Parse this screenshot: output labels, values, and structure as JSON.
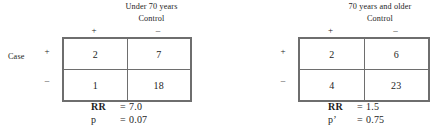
{
  "figure": {
    "panels": [
      {
        "stratum_title": "Under 70 years",
        "control_label": "Control",
        "row_group_label": "Case",
        "column_signs": [
          "+",
          "–"
        ],
        "row_signs": [
          "+",
          "–"
        ],
        "cells": [
          [
            "2",
            "7"
          ],
          [
            "1",
            "18"
          ]
        ],
        "stats": [
          {
            "key": "RR",
            "eq": "=",
            "value": "7.0"
          },
          {
            "key": "p",
            "eq": "=",
            "value": "0.07"
          }
        ]
      },
      {
        "stratum_title": "70 years and older",
        "control_label": "Control",
        "row_group_label": "",
        "column_signs": [
          "+",
          "–"
        ],
        "row_signs": [
          "+",
          "–"
        ],
        "cells": [
          [
            "2",
            "6"
          ],
          [
            "4",
            "23"
          ]
        ],
        "stats": [
          {
            "key": "RR",
            "eq": "=",
            "value": "1.5"
          },
          {
            "key": "p’",
            "eq": "=",
            "value": "0.75"
          }
        ]
      }
    ],
    "colors": {
      "background": "#ffffff",
      "text": "#1d1d1d",
      "table_border": "#6e6e6e"
    }
  }
}
